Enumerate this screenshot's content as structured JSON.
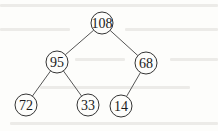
{
  "diagram": {
    "type": "binary-tree",
    "nodes": [
      {
        "id": "n0",
        "label": "108",
        "x": 102,
        "y": 23
      },
      {
        "id": "n1",
        "label": "95",
        "x": 57,
        "y": 62
      },
      {
        "id": "n2",
        "label": "68",
        "x": 146,
        "y": 63
      },
      {
        "id": "n3",
        "label": "72",
        "x": 26,
        "y": 105
      },
      {
        "id": "n4",
        "label": "33",
        "x": 88,
        "y": 105
      },
      {
        "id": "n5",
        "label": "14",
        "x": 121,
        "y": 106
      }
    ],
    "edges": [
      {
        "from": "n0",
        "to": "n1"
      },
      {
        "from": "n0",
        "to": "n2"
      },
      {
        "from": "n1",
        "to": "n3"
      },
      {
        "from": "n1",
        "to": "n4"
      },
      {
        "from": "n2",
        "to": "n5"
      }
    ],
    "node_radius": 11,
    "colors": {
      "stroke": "#333333",
      "edge": "#555555",
      "background": "#fdfdfb"
    }
  }
}
